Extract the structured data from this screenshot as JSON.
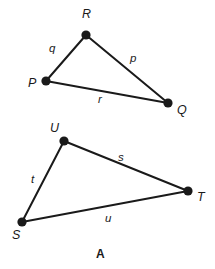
{
  "figure": {
    "caption": "A",
    "caption_position": {
      "x": 96,
      "y": 248
    },
    "stroke_color": "#1a1a1a",
    "vertex_color": "#1a1a1a",
    "background_color": "#ffffff",
    "triangles": [
      {
        "name": "triangle-PQR",
        "vertices": [
          {
            "label": "P",
            "cx": 46,
            "cy": 81,
            "label_x": 28,
            "label_y": 77
          },
          {
            "label": "Q",
            "cx": 168,
            "cy": 103,
            "label_x": 177,
            "label_y": 104
          },
          {
            "label": "R",
            "cx": 86,
            "cy": 35,
            "label_x": 82,
            "label_y": 8
          }
        ],
        "sides": [
          {
            "label": "q",
            "from": "P",
            "to": "R",
            "label_x": 49,
            "label_y": 43
          },
          {
            "label": "p",
            "from": "R",
            "to": "Q",
            "label_x": 130,
            "label_y": 53
          },
          {
            "label": "r",
            "from": "P",
            "to": "Q",
            "label_x": 98,
            "label_y": 94
          }
        ]
      },
      {
        "name": "triangle-STU",
        "vertices": [
          {
            "label": "U",
            "cx": 64,
            "cy": 141,
            "label_x": 50,
            "label_y": 122
          },
          {
            "label": "T",
            "cx": 188,
            "cy": 191,
            "label_x": 197,
            "label_y": 191
          },
          {
            "label": "S",
            "cx": 22,
            "cy": 222,
            "label_x": 12,
            "label_y": 229
          }
        ],
        "sides": [
          {
            "label": "s",
            "from": "U",
            "to": "T",
            "label_x": 118,
            "label_y": 152
          },
          {
            "label": "t",
            "from": "S",
            "to": "U",
            "label_x": 31,
            "label_y": 174
          },
          {
            "label": "u",
            "from": "S",
            "to": "T",
            "label_x": 105,
            "label_y": 213
          }
        ]
      }
    ]
  }
}
